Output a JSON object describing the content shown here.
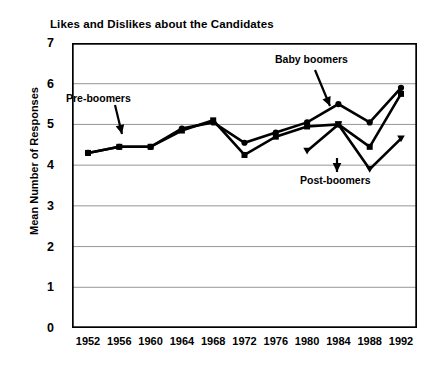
{
  "chart_data": {
    "type": "line",
    "title": "Likes and Dislikes about the Candidates",
    "xlabel": "",
    "ylabel": "Mean Number of Responses",
    "categories": [
      "1952",
      "1956",
      "1960",
      "1964",
      "1968",
      "1972",
      "1976",
      "1980",
      "1984",
      "1988",
      "1992"
    ],
    "ylim": [
      0,
      7
    ],
    "yticks": [
      "0",
      "1",
      "2",
      "3",
      "4",
      "5",
      "6",
      "7"
    ],
    "grid": true,
    "legend_position": "annotations",
    "series": [
      {
        "name": "Pre-boomers",
        "marker": "circle",
        "color": "#000000",
        "values": [
          4.3,
          4.45,
          4.45,
          4.9,
          5.05,
          4.55,
          4.8,
          5.05,
          5.5,
          5.05,
          5.9
        ]
      },
      {
        "name": "Baby boomers",
        "marker": "square",
        "color": "#000000",
        "values": [
          4.3,
          4.45,
          4.45,
          4.85,
          5.1,
          4.25,
          4.7,
          4.95,
          5.0,
          4.45,
          5.75
        ]
      },
      {
        "name": "Post-boomers",
        "marker": "triangle",
        "color": "#000000",
        "values": [
          null,
          null,
          null,
          null,
          null,
          null,
          null,
          4.35,
          5.0,
          3.9,
          4.65
        ]
      }
    ],
    "annotations": [
      {
        "text": "Pre-boomers",
        "name": "pre-boomers"
      },
      {
        "text": "Baby boomers",
        "name": "baby-boomers"
      },
      {
        "text": "Post-boomers",
        "name": "post-boomers"
      }
    ]
  }
}
